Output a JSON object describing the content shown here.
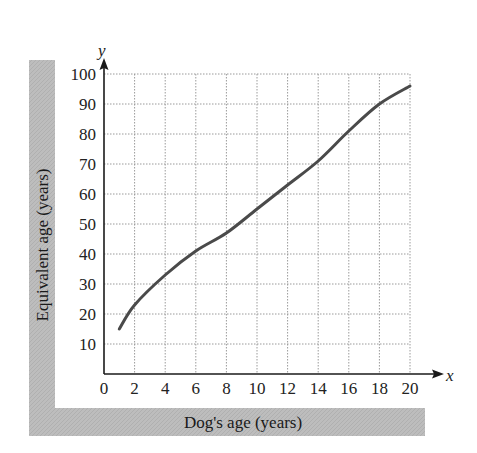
{
  "chart_data": {
    "type": "line",
    "title": "",
    "xlabel": "Dog's age (years)",
    "ylabel": "Equivalent age (years)",
    "x_axis_var": "x",
    "y_axis_var": "y",
    "xlim": [
      0,
      20
    ],
    "ylim": [
      0,
      100
    ],
    "x_ticks": [
      0,
      2,
      4,
      6,
      8,
      10,
      12,
      14,
      16,
      18,
      20
    ],
    "y_ticks": [
      10,
      20,
      30,
      40,
      50,
      60,
      70,
      80,
      90,
      100
    ],
    "grid": true,
    "legend": null,
    "series": [
      {
        "name": "Equivalent age",
        "x": [
          1,
          2,
          4,
          6,
          8,
          10,
          12,
          14,
          16,
          18,
          20
        ],
        "y": [
          15,
          23,
          33,
          41,
          47,
          55,
          63,
          71,
          81,
          90,
          96
        ]
      }
    ]
  },
  "colors": {
    "curve": "#4a4a4a",
    "band": "#bdbdbd",
    "grid": "#9a9a9a",
    "axis": "#1a1a1a"
  }
}
